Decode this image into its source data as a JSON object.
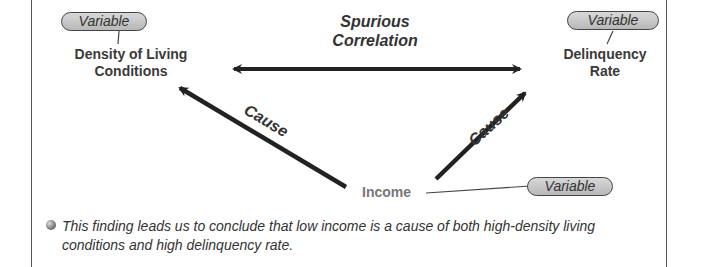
{
  "diagram": {
    "title": "Spurious Correlation",
    "title_lines": [
      "Spurious",
      "Correlation"
    ],
    "nodes": {
      "left": {
        "lines": [
          "Density of Living",
          "Conditions"
        ],
        "tag": "Variable"
      },
      "right": {
        "lines": [
          "Delinquency",
          "Rate"
        ],
        "tag": "Variable"
      },
      "bottom": {
        "label": "Income",
        "tag": "Variable"
      }
    },
    "edges": [
      {
        "from": "Income",
        "to": "Density of Living Conditions",
        "label": "Cause"
      },
      {
        "from": "Income",
        "to": "Delinquency Rate",
        "label": "Cause"
      },
      {
        "from": "Density of Living Conditions",
        "to": "Delinquency Rate",
        "label": "Spurious Correlation",
        "bidirectional": true
      }
    ]
  },
  "note": {
    "bullet": "This finding leads us to conclude that low income is a cause of both high-density living conditions and high delinquency rate."
  }
}
